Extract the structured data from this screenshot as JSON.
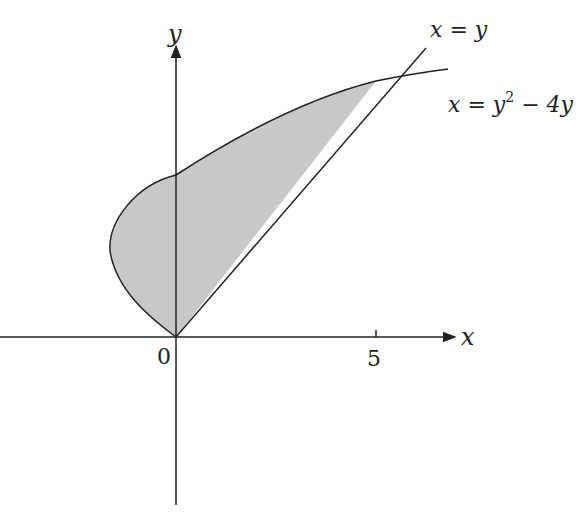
{
  "diagram": {
    "axes": {
      "x_label": "x",
      "y_label": "y",
      "origin_label": "0",
      "x_tick_label": "5"
    },
    "curves": [
      {
        "name": "line",
        "label": "x = y"
      },
      {
        "name": "parabola",
        "label_base": "x = y",
        "label_sup": "2",
        "label_tail": " − 4y"
      }
    ],
    "shaded_region": {
      "description": "Region bounded by x = y^2 - 4y and x = y from (0,0) to (5,5)",
      "fill": "#c8c8c8"
    },
    "colors": {
      "stroke": "#222222",
      "fill": "#c8c8c8",
      "background": "#ffffff"
    }
  }
}
